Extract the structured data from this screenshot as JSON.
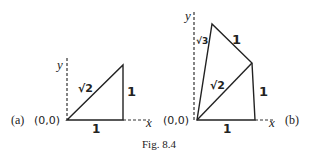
{
  "caption": "Fig. 8.4",
  "panel_a": {
    "tag": "(a)",
    "origin_label": "(0,0)",
    "x_axis_label": "x",
    "y_axis_label": "y",
    "edges": {
      "hypotenuse": "√2",
      "vertical": "1",
      "horizontal": "1"
    }
  },
  "panel_b": {
    "tag": "(b)",
    "origin_label": "(0,0)",
    "x_axis_label": "x",
    "y_axis_label": "y",
    "edges": {
      "long_diagonal": "√3",
      "top": "1",
      "middle_diagonal": "√2",
      "vertical": "1",
      "horizontal": "1"
    }
  }
}
